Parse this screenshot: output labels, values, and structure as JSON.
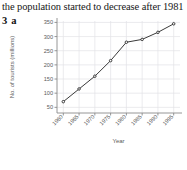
{
  "header": {
    "sentence": "the population started to decrease after 1981"
  },
  "question": {
    "number": "3",
    "part": "a"
  },
  "chart_data": {
    "type": "line",
    "title": "",
    "xlabel": "Year",
    "ylabel": "No. of tourists (millions)",
    "x": [
      1960,
      1965,
      1970,
      1975,
      1980,
      1985,
      1990,
      1995
    ],
    "values": [
      70,
      115,
      160,
      215,
      280,
      290,
      315,
      345
    ],
    "xticklabels": [
      "1960",
      "1965",
      "1970",
      "1975",
      "1980",
      "1985",
      "1990",
      "1995"
    ],
    "yticklabels": [
      "50",
      "100",
      "150",
      "200",
      "250",
      "300",
      "350"
    ],
    "yticks": [
      50,
      100,
      150,
      200,
      250,
      300,
      350
    ],
    "xlim": [
      1958,
      1997
    ],
    "ylim": [
      30,
      355
    ],
    "grid": true,
    "legend": "none",
    "line_color": "#3a3a3a",
    "marker": "circle",
    "marker_color": "#2b2b2b",
    "grid_color": "#e2e2e6",
    "axis_color": "#8a8a8a"
  }
}
